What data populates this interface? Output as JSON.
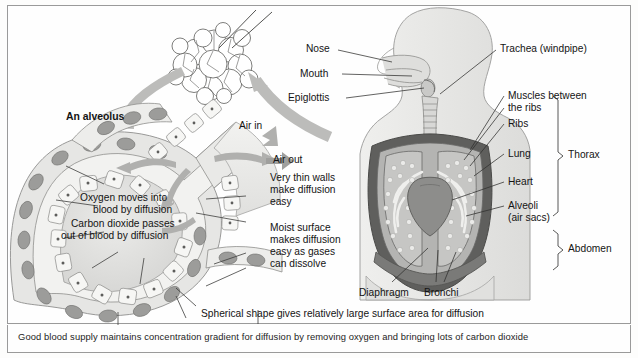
{
  "figure": {
    "title_label": "An alveolus",
    "caption": "Good blood supply maintains concentration gradient for diffusion by removing oxygen and bringing lots of carbon dioxide",
    "bottom_note": "Spherical shape gives relatively large surface area for diffusion"
  },
  "alveolus": {
    "label": "An alveolus",
    "air_in": "Air in",
    "air_out": "Air out",
    "oxygen_text_line1": "Oxygen moves into",
    "oxygen_text_line2": "blood by diffusion",
    "co2_text_line1": "Carbon dioxide passes",
    "co2_text_line2": "out of blood by diffusion",
    "thin_walls_line1": "Very thin walls",
    "thin_walls_line2": "make diffusion",
    "thin_walls_line3": "easy",
    "moist_line1": "Moist surface",
    "moist_line2": "makes diffusion",
    "moist_line3": "easy as gases",
    "moist_line4": "can dissolve"
  },
  "torso": {
    "left_labels": [
      {
        "name": "nose",
        "text": "Nose"
      },
      {
        "name": "mouth",
        "text": "Mouth"
      },
      {
        "name": "epiglottis",
        "text": "Epiglottis"
      }
    ],
    "right_labels": [
      {
        "name": "trachea",
        "text": "Trachea (windpipe)"
      },
      {
        "name": "muscles-between-ribs-1",
        "text": "Muscles between"
      },
      {
        "name": "muscles-between-ribs-2",
        "text": "the ribs"
      },
      {
        "name": "ribs",
        "text": "Ribs"
      },
      {
        "name": "lung",
        "text": "Lung"
      },
      {
        "name": "heart",
        "text": "Heart"
      },
      {
        "name": "alveoli-1",
        "text": "Alveoli"
      },
      {
        "name": "alveoli-2",
        "text": "(air sacs)"
      }
    ],
    "bottom_labels": [
      {
        "name": "diaphragm",
        "text": "Diaphragm"
      },
      {
        "name": "bronchi",
        "text": "Bronchi"
      }
    ],
    "brackets": [
      {
        "name": "thorax",
        "text": "Thorax"
      },
      {
        "name": "abdomen",
        "text": "Abdomen"
      }
    ]
  },
  "colors": {
    "ink": "#141414",
    "border": "#9a9a9a",
    "arrow_grey": "#b9b9b9",
    "tissue_light": "#e3e3e1",
    "tissue_mid": "#bdbdbb",
    "tissue_dark": "#8a8a88",
    "rib_dark": "#6e6e6c",
    "cell_fill": "#efefed",
    "nucleus": "#9b9b99"
  }
}
